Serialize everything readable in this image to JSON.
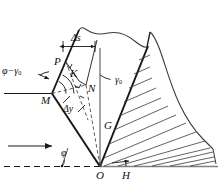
{
  "figure": {
    "stroke_color": "#1a1a1a",
    "background": "#ffffff"
  },
  "labels": {
    "point_P": "P",
    "point_K": "K",
    "point_N": "N",
    "point_M": "M",
    "point_G": "G",
    "point_O": "O",
    "point_H": "H",
    "angle_phi_minus_gamma": "φ−γ",
    "angle_phi_minus_gamma_sub": "0",
    "angle_gamma_zero": "γ",
    "angle_gamma_zero_sub": "0",
    "angle_phi": "φ",
    "dim_delta_s": "Δs",
    "dim_delta_y": "Δy"
  },
  "annotations": {
    "flow_arrow": "flow-direction-arrow",
    "ground_line": "ground-surface-line",
    "hatching": "bedrock-hatching",
    "terrain": "terrain-profile"
  }
}
